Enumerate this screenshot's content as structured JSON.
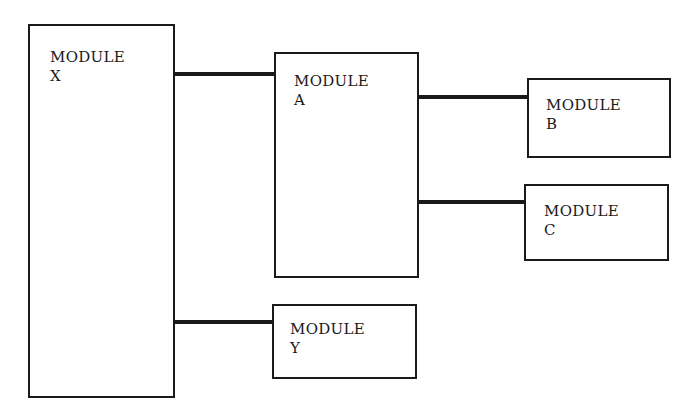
{
  "diagram": {
    "type": "module-hierarchy",
    "modules": [
      {
        "id": "X",
        "line1": "MODULE",
        "line2": "X"
      },
      {
        "id": "A",
        "line1": "MODULE",
        "line2": "A"
      },
      {
        "id": "B",
        "line1": "MODULE",
        "line2": "B"
      },
      {
        "id": "C",
        "line1": "MODULE",
        "line2": "C"
      },
      {
        "id": "Y",
        "line1": "MODULE",
        "line2": "Y"
      }
    ],
    "connections": [
      {
        "from": "X",
        "to": "A"
      },
      {
        "from": "X",
        "to": "Y"
      },
      {
        "from": "A",
        "to": "B"
      },
      {
        "from": "A",
        "to": "C"
      }
    ],
    "colors": {
      "line": "#1a1a1a",
      "background": "#ffffff"
    }
  }
}
